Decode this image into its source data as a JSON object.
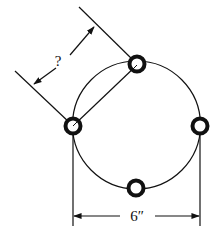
{
  "diagram": {
    "labels": {
      "unknown_distance": "?",
      "diameter": "6″"
    },
    "colors": {
      "stroke": "#111111",
      "background": "#ffffff"
    },
    "holes": [
      {
        "name": "top-hole"
      },
      {
        "name": "left-hole"
      },
      {
        "name": "right-hole"
      },
      {
        "name": "bottom-hole"
      }
    ]
  }
}
